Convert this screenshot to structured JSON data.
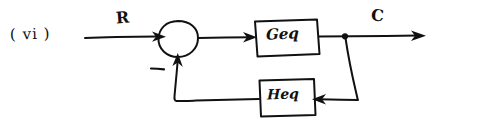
{
  "diagram": {
    "type": "control-system-block-diagram",
    "title_label": "( vi )",
    "ink_color": "#111111",
    "background_color": "#ffffff",
    "style": "hand-drawn pen sketch",
    "signals": {
      "input_label": "R",
      "output_label": "C",
      "feedback_sign": "–"
    },
    "blocks": [
      {
        "name": "forward-path-block",
        "label": "Geq",
        "position": "top-center"
      },
      {
        "name": "feedback-path-block",
        "label": "Heq",
        "position": "bottom-center"
      }
    ],
    "summing_junction": {
      "name": "summing-junction",
      "shape": "circle",
      "inputs": [
        "R",
        "feedback"
      ],
      "sign_label": "–"
    },
    "takeoff_point": {
      "name": "takeoff-point",
      "shape": "dot"
    }
  }
}
